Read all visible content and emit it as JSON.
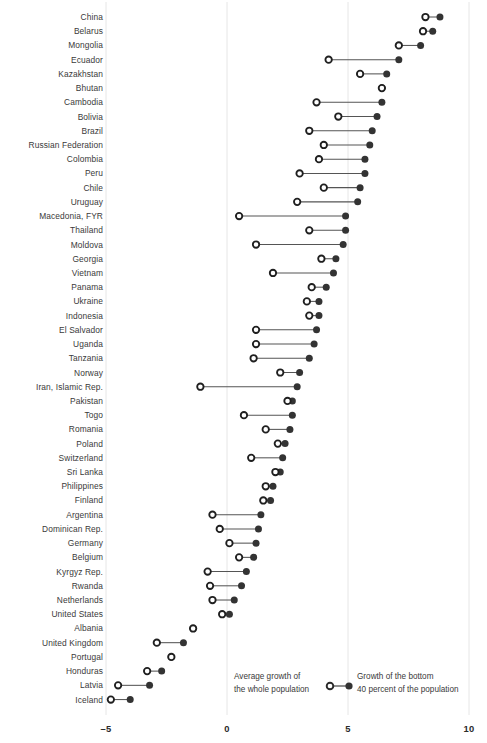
{
  "chart": {
    "type_note": "dumbbell dot plot",
    "axis": {
      "ticks": [
        "–5",
        "0",
        "5",
        "10"
      ],
      "tick_values": [
        -5,
        0,
        5,
        10
      ]
    },
    "legend": {
      "left_line1": "Average growth of",
      "left_line2": "the whole population",
      "right_line1": "Growth of the bottom",
      "right_line2": "40 percent of the population",
      "hollow_marker_name": "average-growth-marker",
      "filled_marker_name": "bottom40-growth-marker"
    },
    "colors": {
      "marker": "#333333",
      "connector": "#555555",
      "gridline": "#e6e6e6",
      "axis_text": "#2b2b2b",
      "label_text": "#3a3a3a",
      "background": "#ffffff"
    }
  },
  "chart_data": {
    "type": "scatter",
    "title": "",
    "subtitle": "",
    "xlabel": "",
    "ylabel": "",
    "xlim": [
      -5,
      10
    ],
    "xticks": [
      -5,
      0,
      5,
      10
    ],
    "grid": "vertical-only",
    "legend_position": "bottom",
    "series": [
      {
        "name": "Average growth of the whole population",
        "marker": "hollow-circle"
      },
      {
        "name": "Growth of the bottom 40 percent of the population",
        "marker": "filled-circle"
      }
    ],
    "categories": [
      "China",
      "Belarus",
      "Mongolia",
      "Ecuador",
      "Kazakhstan",
      "Bhutan",
      "Cambodia",
      "Bolivia",
      "Brazil",
      "Russian Federation",
      "Colombia",
      "Peru",
      "Chile",
      "Uruguay",
      "Macedonia, FYR",
      "Thailand",
      "Moldova",
      "Georgia",
      "Vietnam",
      "Panama",
      "Ukraine",
      "Indonesia",
      "El Salvador",
      "Uganda",
      "Tanzania",
      "Norway",
      "Iran, Islamic Rep.",
      "Pakistan",
      "Togo",
      "Romania",
      "Poland",
      "Switzerland",
      "Sri Lanka",
      "Philippines",
      "Finland",
      "Argentina",
      "Dominican Rep.",
      "Germany",
      "Belgium",
      "Kyrgyz Rep.",
      "Rwanda",
      "Netherlands",
      "United States",
      "Albania",
      "United Kingdom",
      "Portugal",
      "Honduras",
      "Latvia",
      "Iceland"
    ],
    "average_growth": [
      8.2,
      8.1,
      7.1,
      4.2,
      5.5,
      6.4,
      3.7,
      4.6,
      3.4,
      4.0,
      3.8,
      3.0,
      4.0,
      2.9,
      0.5,
      3.4,
      1.2,
      3.9,
      1.9,
      3.5,
      3.3,
      3.4,
      1.2,
      1.2,
      1.1,
      2.2,
      -1.1,
      2.5,
      0.7,
      1.6,
      2.1,
      1.0,
      2.0,
      1.6,
      1.5,
      -0.6,
      -0.3,
      0.1,
      0.5,
      -0.8,
      -0.7,
      -0.6,
      -0.2,
      -1.4,
      -2.9,
      -2.3,
      -3.3,
      -4.5,
      -4.8
    ],
    "bottom40_growth": [
      8.8,
      8.5,
      8.0,
      7.1,
      6.6,
      6.4,
      6.4,
      6.2,
      6.0,
      5.9,
      5.7,
      5.7,
      5.5,
      5.4,
      4.9,
      4.9,
      4.8,
      4.5,
      4.4,
      4.1,
      3.8,
      3.8,
      3.7,
      3.6,
      3.4,
      3.0,
      2.9,
      2.7,
      2.7,
      2.6,
      2.4,
      2.3,
      2.2,
      1.9,
      1.8,
      1.4,
      1.3,
      1.2,
      1.1,
      0.8,
      0.6,
      0.3,
      0.1,
      -1.4,
      -1.8,
      -2.3,
      -2.7,
      -3.2,
      -4.0
    ]
  }
}
